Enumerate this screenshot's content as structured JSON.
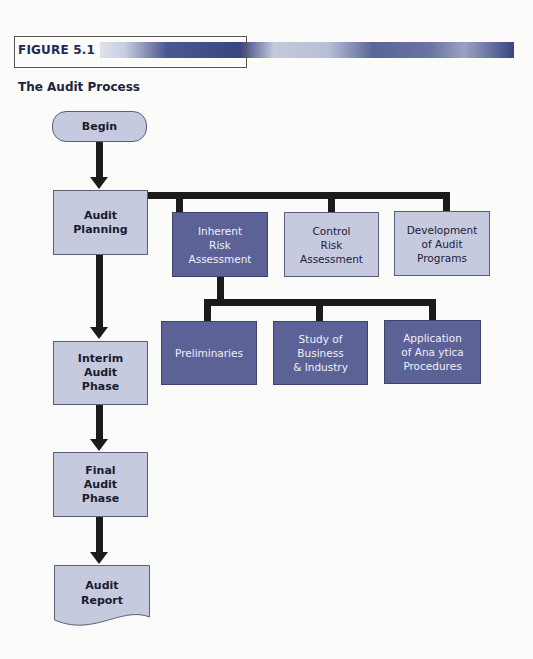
{
  "figure": {
    "label": "FIGURE 5.1",
    "title": "The Audit Process",
    "colors": {
      "light_box": "#c5cadf",
      "dark_box": "#5c6296",
      "connector": "#1c1a1a",
      "banner_dark": "#3b4680"
    }
  },
  "main_flow": [
    {
      "id": "begin",
      "label": "Begin",
      "shape": "terminator"
    },
    {
      "id": "planning",
      "label": "Audit\nPlanning",
      "shape": "process"
    },
    {
      "id": "interim",
      "label": "Interim\nAudit\nPhase",
      "shape": "process"
    },
    {
      "id": "final",
      "label": "Final\nAudit\nPhase",
      "shape": "process"
    },
    {
      "id": "report",
      "label": "Audit\nReport",
      "shape": "document"
    }
  ],
  "planning_components": [
    {
      "id": "inherent",
      "label": "Inherent\nRisk\nAssessment",
      "style": "dark"
    },
    {
      "id": "control",
      "label": "Control\nRisk\nAssessment",
      "style": "light"
    },
    {
      "id": "development",
      "label": "Development\nof Audit\nPrograms",
      "style": "light"
    }
  ],
  "inherent_risk_components": [
    {
      "id": "preliminaries",
      "label": "Preliminaries",
      "style": "dark"
    },
    {
      "id": "study",
      "label": "Study of\nBusiness\n& Industry",
      "style": "dark"
    },
    {
      "id": "application",
      "label": "Application\nof Ana ytica\nProcedures",
      "style": "dark"
    }
  ],
  "edges": [
    [
      "begin",
      "planning"
    ],
    [
      "planning",
      "interim"
    ],
    [
      "interim",
      "final"
    ],
    [
      "final",
      "report"
    ],
    [
      "planning",
      "inherent"
    ],
    [
      "planning",
      "control"
    ],
    [
      "planning",
      "development"
    ],
    [
      "inherent",
      "preliminaries"
    ],
    [
      "inherent",
      "study"
    ],
    [
      "inherent",
      "application"
    ]
  ]
}
